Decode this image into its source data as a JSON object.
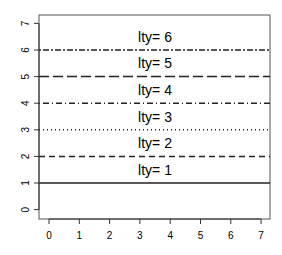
{
  "chart_data": {
    "type": "line",
    "title": "",
    "xlabel": "",
    "ylabel": "",
    "xlim": [
      -0.3,
      7.3
    ],
    "ylim": [
      -0.3,
      7.3
    ],
    "x_ticks": [
      "0",
      "1",
      "2",
      "3",
      "4",
      "5",
      "6",
      "7"
    ],
    "y_ticks": [
      "0",
      "1",
      "2",
      "3",
      "4",
      "5",
      "6",
      "7"
    ],
    "grid": false,
    "legend": null,
    "series": [
      {
        "name": "lty= 1",
        "y": 1,
        "lty": 1,
        "dash": ""
      },
      {
        "name": "lty= 2",
        "y": 2,
        "lty": 2,
        "dash": "6,4"
      },
      {
        "name": "lty= 3",
        "y": 3,
        "lty": 3,
        "dash": "1,3"
      },
      {
        "name": "lty= 4",
        "y": 4,
        "lty": 4,
        "dash": "1,3,6,3"
      },
      {
        "name": "lty= 5",
        "y": 5,
        "lty": 5,
        "dash": "10,4"
      },
      {
        "name": "lty= 6",
        "y": 6,
        "lty": 6,
        "dash": "2,2,6,2"
      }
    ],
    "annotations": [
      {
        "text": "lty= 1",
        "x": 3.5,
        "y": 1.5
      },
      {
        "text": "lty= 2",
        "x": 3.5,
        "y": 2.5
      },
      {
        "text": "lty= 3",
        "x": 3.5,
        "y": 3.5
      },
      {
        "text": "lty= 4",
        "x": 3.5,
        "y": 4.5
      },
      {
        "text": "lty= 5",
        "x": 3.5,
        "y": 5.5
      },
      {
        "text": "lty= 6",
        "x": 3.5,
        "y": 6.5
      }
    ]
  }
}
